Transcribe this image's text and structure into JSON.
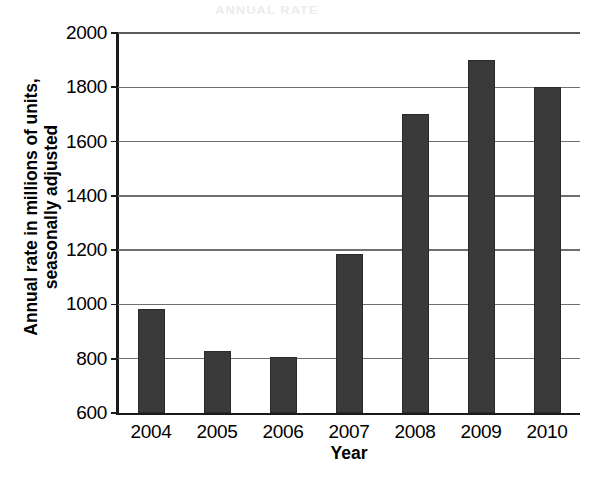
{
  "chart_data": {
    "type": "bar",
    "title": "",
    "xlabel": "Year",
    "ylabel": "Annual rate in millions of units, seasonally adjusted",
    "ylabel_lines": [
      "Annual rate in millions of units,",
      "seasonally adjusted"
    ],
    "categories": [
      "2004",
      "2005",
      "2006",
      "2007",
      "2008",
      "2009",
      "2010"
    ],
    "values": [
      985,
      830,
      805,
      1185,
      1700,
      1900,
      1800
    ],
    "ylim": [
      600,
      2000
    ],
    "xlim_categories": 7,
    "ytick_labels": [
      "600",
      "800",
      "1000",
      "1200",
      "1400",
      "1600",
      "1800",
      "2000"
    ],
    "ytick_values": [
      600,
      800,
      1000,
      1200,
      1400,
      1600,
      1800,
      2000
    ],
    "grid": true,
    "grid_axis": "y",
    "legend": false,
    "legend_position": "none",
    "bar_color": "#3a3a3a",
    "grid_color": "#6f6f6f",
    "axis_color": "#1a1a1a",
    "background": "#ffffff"
  },
  "artifacts": {
    "scan_bleed_text": "ANNUAL RATE"
  }
}
